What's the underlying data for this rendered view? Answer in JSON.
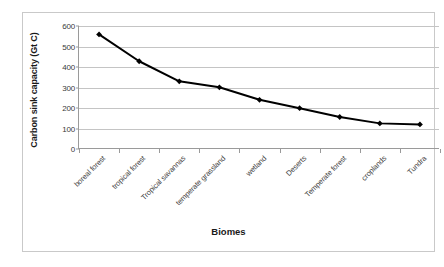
{
  "chart_data": {
    "type": "line",
    "title": "",
    "xlabel": "Biomes",
    "ylabel": "Carbon sink capacity (Gt C)",
    "categories": [
      "boreal forest",
      "tropical forest",
      "Tropical savannas",
      "temperate grassland",
      "wetland",
      "Deserts",
      "Temperate forest",
      "croplands",
      "Tundra"
    ],
    "values": [
      559,
      428,
      330,
      301,
      240,
      199,
      156,
      125,
      120
    ],
    "ylim": [
      0,
      600
    ],
    "yticks": [
      0,
      100,
      200,
      300,
      400,
      500,
      600
    ],
    "ytick_labels": [
      "0",
      "100",
      "200",
      "300",
      "400",
      "500",
      "600"
    ],
    "grid": true,
    "legend": false,
    "series_color": "#000000",
    "marker": "diamond",
    "gridline_color": "#c4c4c4",
    "axis_color": "#9a9a9a",
    "plot_background": "#ffffff"
  }
}
